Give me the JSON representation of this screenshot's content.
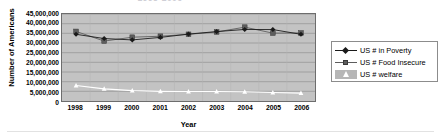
{
  "chart_data": {
    "type": "line",
    "title": "1998-2006",
    "xlabel": "Year",
    "ylabel": "Number of Americans",
    "categories": [
      "1998",
      "1999",
      "2000",
      "2001",
      "2002",
      "2003",
      "2004",
      "2005",
      "2006"
    ],
    "ylim": [
      0,
      45000000
    ],
    "ytick_values": [
      45000000,
      40000000,
      35000000,
      30000000,
      25000000,
      20000000,
      15000000,
      10000000,
      5000000,
      0
    ],
    "ytick_labels": [
      "45,000,000",
      "40,000,000",
      "35,000,000",
      "30,000,000",
      "25,000,000",
      "20,000,000",
      "15,000,000",
      "10,000,000",
      "5,000,000",
      "0"
    ],
    "grid": true,
    "legend_position": "right",
    "series": [
      {
        "name": "US # in Poverty",
        "marker": "diamond",
        "color": "#1a1a1a",
        "values": [
          34500000,
          32300000,
          31600000,
          32900000,
          34600000,
          35900000,
          37000000,
          36950000,
          34500000
        ]
      },
      {
        "name": "US # Food Insecure",
        "marker": "square",
        "color": "#5d5d5d",
        "values": [
          36000000,
          31000000,
          33000000,
          33500000,
          34500000,
          35700000,
          38200000,
          35100000,
          35200000
        ]
      },
      {
        "name": "US # welfare",
        "marker": "triangle",
        "color": "#ffffff",
        "values": [
          8000000,
          6300000,
          5400000,
          5000000,
          4900000,
          4900000,
          4800000,
          4400000,
          4100000
        ]
      }
    ]
  },
  "legend": {
    "items": [
      {
        "label": "US # in Poverty"
      },
      {
        "label": "US # Food Insecure"
      },
      {
        "label": "US # welfare"
      }
    ]
  }
}
